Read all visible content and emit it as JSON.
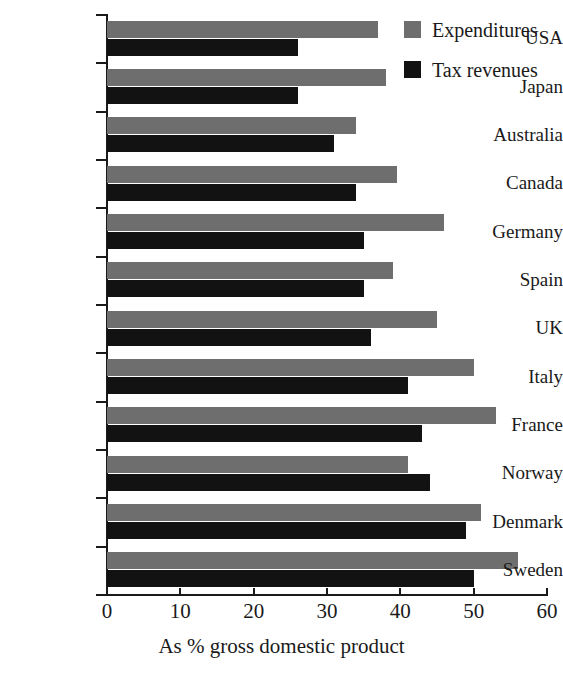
{
  "chart_data": {
    "type": "bar",
    "orientation": "horizontal",
    "title": "",
    "xlabel": "As % gross domestic product",
    "ylabel": "",
    "xlim": [
      0,
      60
    ],
    "xticks": [
      0,
      10,
      20,
      30,
      40,
      50,
      60
    ],
    "xtick_labels": [
      "0",
      "10",
      "20",
      "30",
      "40",
      "50",
      "60"
    ],
    "grid": false,
    "legend_position": "top-right",
    "categories": [
      "USA",
      "Japan",
      "Australia",
      "Canada",
      "Germany",
      "Spain",
      "UK",
      "Italy",
      "France",
      "Norway",
      "Denmark",
      "Sweden"
    ],
    "series": [
      {
        "name": "Expenditures",
        "color": "#6e6e6e",
        "values": [
          37,
          38,
          34,
          39.5,
          46,
          39,
          45,
          50,
          53,
          41,
          51,
          56
        ]
      },
      {
        "name": "Tax revenues",
        "color": "#121212",
        "values": [
          26,
          26,
          31,
          34,
          35,
          35,
          36,
          41,
          43,
          44,
          49,
          50
        ]
      }
    ]
  },
  "legend": {
    "items": [
      {
        "label": "Expenditures",
        "color": "#6e6e6e"
      },
      {
        "label": "Tax revenues",
        "color": "#121212"
      }
    ]
  },
  "axis": {
    "x_title": "As % gross domestic product"
  }
}
